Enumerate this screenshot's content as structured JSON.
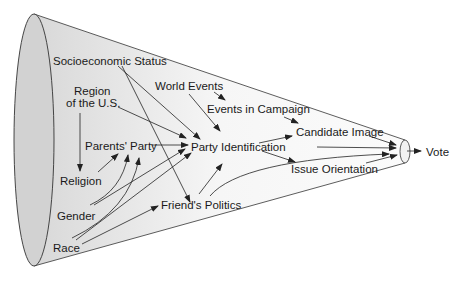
{
  "colors": {
    "cone_fill_light": "#f4f4f4",
    "cone_fill_dark": "#d4d4d4",
    "stroke": "#222222",
    "text": "#1a1a1a",
    "background": "#ffffff"
  },
  "nodes": {
    "socioeconomic_status": "Socioeconomic Status",
    "region_line1": "Region",
    "region_line2": "of the U.S.",
    "world_events": "World Events",
    "events_in_campaign": "Events in Campaign",
    "candidate_image": "Candidate Image",
    "parents_party": "Parents' Party",
    "party_identification": "Party Identification",
    "religion": "Religion",
    "issue_orientation": "Issue Orientation",
    "vote": "Vote",
    "gender": "Gender",
    "friends_politics": "Friend's Politics",
    "race": "Race"
  },
  "edges": [
    {
      "from": "Socioeconomic Status",
      "to": "Party Identification"
    },
    {
      "from": "Socioeconomic Status",
      "to": "Friend's Politics"
    },
    {
      "from": "Region of the U.S.",
      "to": "Religion"
    },
    {
      "from": "Region of the U.S.",
      "to": "Party Identification"
    },
    {
      "from": "World Events",
      "to": "Events in Campaign"
    },
    {
      "from": "World Events",
      "to": "Party Identification"
    },
    {
      "from": "Events in Campaign",
      "to": "Candidate Image"
    },
    {
      "from": "Parents' Party",
      "to": "Party Identification"
    },
    {
      "from": "Religion",
      "to": "Parents' Party"
    },
    {
      "from": "Gender",
      "to": "Parents' Party"
    },
    {
      "from": "Gender",
      "to": "Party Identification"
    },
    {
      "from": "Race",
      "to": "Parents' Party"
    },
    {
      "from": "Race",
      "to": "Party Identification"
    },
    {
      "from": "Race",
      "to": "Friend's Politics"
    },
    {
      "from": "Friend's Politics",
      "to": "Party Identification"
    },
    {
      "from": "Friend's Politics",
      "to": "Vote"
    },
    {
      "from": "Party Identification",
      "to": "Candidate Image"
    },
    {
      "from": "Party Identification",
      "to": "Issue Orientation"
    },
    {
      "from": "Party Identification",
      "to": "Vote"
    },
    {
      "from": "Candidate Image",
      "to": "Vote"
    },
    {
      "from": "Issue Orientation",
      "to": "Vote"
    }
  ]
}
